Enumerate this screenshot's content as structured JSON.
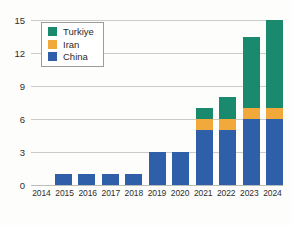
{
  "chart_data": {
    "type": "bar",
    "stacked": true,
    "title": "",
    "subtitle": "",
    "xlabel": "",
    "ylabel": "",
    "categories": [
      "2014",
      "2015",
      "2016",
      "2017",
      "2018",
      "2019",
      "2020",
      "2021",
      "2022",
      "2023",
      "2024"
    ],
    "series": [
      {
        "name": "China",
        "color": "#2f5fa8",
        "values": [
          0,
          1,
          1,
          1,
          1,
          3,
          3,
          5,
          5,
          6,
          6
        ]
      },
      {
        "name": "Iran",
        "color": "#f2a93b",
        "values": [
          0,
          0,
          0,
          0,
          0,
          0,
          0,
          1,
          1,
          1,
          1
        ]
      },
      {
        "name": "Turkiye",
        "color": "#1a8a6e",
        "values": [
          0,
          0,
          0,
          0,
          0,
          0,
          0,
          1,
          2,
          6.5,
          8
        ]
      }
    ],
    "totals": [
      0,
      1,
      1,
      1,
      1,
      3,
      3,
      7,
      8,
      13.5,
      15
    ],
    "ylim": [
      0,
      15
    ],
    "yticks": [
      0,
      3,
      6,
      9,
      12,
      15
    ],
    "ytick_labels": [
      "0",
      "3",
      "6",
      "9",
      "12",
      "15"
    ],
    "grid": true,
    "legend_position": "upper-left",
    "legend_order": [
      "Turkiye",
      "Iran",
      "China"
    ]
  },
  "legend": {
    "items": [
      {
        "label": "Turkiye",
        "swatch": "legend-swatch-turkiye"
      },
      {
        "label": "Iran",
        "swatch": "legend-swatch-iran"
      },
      {
        "label": "China",
        "swatch": "legend-swatch-china"
      }
    ]
  },
  "colors": {
    "turkiye": "#1a8a6e",
    "iran": "#f2a93b",
    "china": "#2f5fa8",
    "grid": "#c9ccc8",
    "background": "#fdfdfb",
    "text": "#2e2e2e"
  }
}
